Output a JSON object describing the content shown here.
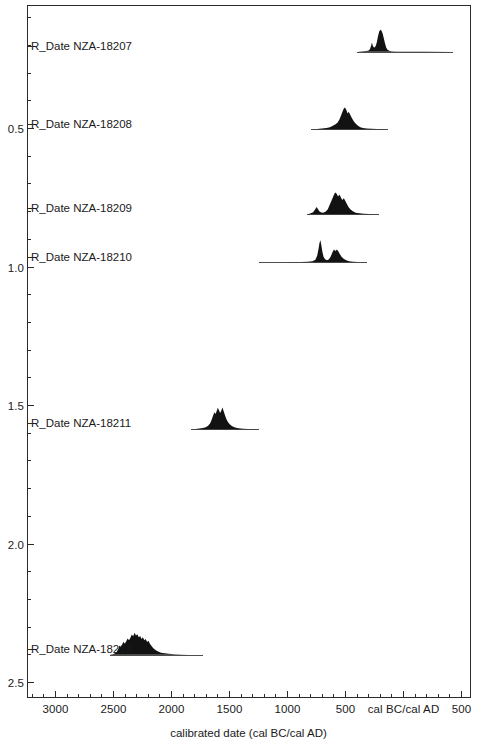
{
  "chart_data": {
    "type": "area",
    "title": "",
    "subtitle": "",
    "xlabel": "calibrated date (cal BC/cal AD)",
    "ylabel": "",
    "xlim": [
      3250,
      620
    ],
    "x_tick_labels": [
      "3000",
      "2500",
      "2000",
      "1500",
      "1000",
      "500",
      "cal BC/cal AD",
      "500"
    ],
    "x_tick_values": [
      3000,
      2500,
      2000,
      1500,
      1000,
      500,
      0,
      -500
    ],
    "x_minor_interval": 100,
    "ylim": [
      0.0,
      2.68
    ],
    "y_tick_labels": [
      "0.5",
      "1.0",
      "1.5",
      "2.0",
      "2.5"
    ],
    "y_tick_values": [
      0.5,
      1.0,
      1.5,
      2.0,
      2.5
    ],
    "y_minor_interval": 0.1,
    "grid": false,
    "legend": "none",
    "frame_color": "#2b2b2b",
    "distribution_color": "#121212",
    "series": [
      {
        "name": "R_Date NZA-18207",
        "label": "R_Date NZA-18207",
        "row": 0,
        "label_y": 0.205,
        "baseline_y": 0.225,
        "range_start": 395,
        "range_end": -430,
        "profile": [
          [
            395,
            0.0
          ],
          [
            370,
            0.02
          ],
          [
            345,
            0.03
          ],
          [
            320,
            0.04
          ],
          [
            300,
            0.05
          ],
          [
            285,
            0.12
          ],
          [
            275,
            0.28
          ],
          [
            268,
            0.42
          ],
          [
            262,
            0.3
          ],
          [
            255,
            0.22
          ],
          [
            245,
            0.2
          ],
          [
            235,
            0.26
          ],
          [
            225,
            0.45
          ],
          [
            215,
            0.72
          ],
          [
            205,
            0.92
          ],
          [
            195,
            1.0
          ],
          [
            185,
            0.96
          ],
          [
            175,
            0.82
          ],
          [
            165,
            0.6
          ],
          [
            155,
            0.38
          ],
          [
            145,
            0.2
          ],
          [
            135,
            0.1
          ],
          [
            120,
            0.05
          ],
          [
            100,
            0.03
          ],
          [
            60,
            0.02
          ],
          [
            0,
            0.01
          ],
          [
            -200,
            0.01
          ],
          [
            -430,
            0.0
          ]
        ]
      },
      {
        "name": "R_Date NZA-18208",
        "label": "R_Date NZA-18208",
        "row": 1,
        "label_y": 0.485,
        "baseline_y": 0.505,
        "range_start": 790,
        "range_end": 130,
        "profile": [
          [
            790,
            0.0
          ],
          [
            740,
            0.02
          ],
          [
            700,
            0.04
          ],
          [
            660,
            0.06
          ],
          [
            630,
            0.1
          ],
          [
            605,
            0.16
          ],
          [
            585,
            0.22
          ],
          [
            565,
            0.3
          ],
          [
            548,
            0.45
          ],
          [
            535,
            0.62
          ],
          [
            522,
            0.8
          ],
          [
            510,
            0.95
          ],
          [
            500,
            1.0
          ],
          [
            488,
            0.88
          ],
          [
            478,
            0.72
          ],
          [
            468,
            0.8
          ],
          [
            458,
            0.7
          ],
          [
            448,
            0.58
          ],
          [
            435,
            0.46
          ],
          [
            420,
            0.34
          ],
          [
            405,
            0.24
          ],
          [
            388,
            0.16
          ],
          [
            368,
            0.1
          ],
          [
            345,
            0.06
          ],
          [
            315,
            0.04
          ],
          [
            275,
            0.03
          ],
          [
            225,
            0.02
          ],
          [
            175,
            0.01
          ],
          [
            130,
            0.0
          ]
        ]
      },
      {
        "name": "R_Date NZA-18209",
        "label": "R_Date NZA-18209",
        "row": 2,
        "label_y": 0.79,
        "baseline_y": 0.812,
        "range_start": 830,
        "range_end": 210,
        "profile": [
          [
            830,
            0.0
          ],
          [
            800,
            0.04
          ],
          [
            775,
            0.1
          ],
          [
            758,
            0.22
          ],
          [
            745,
            0.34
          ],
          [
            735,
            0.26
          ],
          [
            722,
            0.14
          ],
          [
            705,
            0.09
          ],
          [
            688,
            0.08
          ],
          [
            668,
            0.12
          ],
          [
            648,
            0.24
          ],
          [
            630,
            0.46
          ],
          [
            612,
            0.68
          ],
          [
            598,
            0.86
          ],
          [
            585,
            1.0
          ],
          [
            572,
            0.94
          ],
          [
            560,
            0.82
          ],
          [
            548,
            0.9
          ],
          [
            536,
            0.78
          ],
          [
            524,
            0.66
          ],
          [
            510,
            0.74
          ],
          [
            498,
            0.62
          ],
          [
            485,
            0.48
          ],
          [
            470,
            0.34
          ],
          [
            452,
            0.22
          ],
          [
            432,
            0.14
          ],
          [
            408,
            0.08
          ],
          [
            378,
            0.05
          ],
          [
            338,
            0.03
          ],
          [
            290,
            0.02
          ],
          [
            245,
            0.01
          ],
          [
            210,
            0.0
          ]
        ]
      },
      {
        "name": "R_Date NZA-18210",
        "label": "R_Date NZA-18210",
        "row": 3,
        "label_y": 0.965,
        "baseline_y": 0.985,
        "range_start": 1240,
        "range_end": 310,
        "profile": [
          [
            1240,
            0.0
          ],
          [
            1150,
            0.01
          ],
          [
            1050,
            0.01
          ],
          [
            950,
            0.02
          ],
          [
            880,
            0.02
          ],
          [
            820,
            0.03
          ],
          [
            780,
            0.05
          ],
          [
            755,
            0.12
          ],
          [
            740,
            0.3
          ],
          [
            728,
            0.62
          ],
          [
            720,
            0.88
          ],
          [
            712,
            1.0
          ],
          [
            704,
            0.78
          ],
          [
            695,
            0.48
          ],
          [
            685,
            0.26
          ],
          [
            672,
            0.14
          ],
          [
            655,
            0.1
          ],
          [
            638,
            0.14
          ],
          [
            622,
            0.28
          ],
          [
            608,
            0.46
          ],
          [
            595,
            0.58
          ],
          [
            582,
            0.52
          ],
          [
            570,
            0.58
          ],
          [
            558,
            0.5
          ],
          [
            545,
            0.38
          ],
          [
            530,
            0.26
          ],
          [
            512,
            0.16
          ],
          [
            490,
            0.09
          ],
          [
            465,
            0.05
          ],
          [
            430,
            0.03
          ],
          [
            390,
            0.02
          ],
          [
            350,
            0.01
          ],
          [
            310,
            0.0
          ]
        ]
      },
      {
        "name": "R_Date NZA-18211",
        "label": "R_Date NZA-18211",
        "row": 4,
        "label_y": 1.565,
        "baseline_y": 1.588,
        "range_start": 1830,
        "range_end": 1240,
        "profile": [
          [
            1830,
            0.0
          ],
          [
            1790,
            0.02
          ],
          [
            1755,
            0.04
          ],
          [
            1725,
            0.06
          ],
          [
            1700,
            0.1
          ],
          [
            1680,
            0.16
          ],
          [
            1662,
            0.28
          ],
          [
            1648,
            0.46
          ],
          [
            1636,
            0.64
          ],
          [
            1626,
            0.78
          ],
          [
            1616,
            0.7
          ],
          [
            1606,
            0.84
          ],
          [
            1596,
            0.98
          ],
          [
            1586,
            0.86
          ],
          [
            1576,
            0.74
          ],
          [
            1566,
            0.86
          ],
          [
            1556,
            1.0
          ],
          [
            1546,
            0.82
          ],
          [
            1535,
            0.64
          ],
          [
            1522,
            0.46
          ],
          [
            1508,
            0.32
          ],
          [
            1492,
            0.22
          ],
          [
            1472,
            0.14
          ],
          [
            1448,
            0.08
          ],
          [
            1418,
            0.05
          ],
          [
            1380,
            0.03
          ],
          [
            1335,
            0.02
          ],
          [
            1290,
            0.01
          ],
          [
            1240,
            0.0
          ]
        ]
      },
      {
        "name": "R_Date NZA-18212",
        "label": "R_Date NZA-18212",
        "row": 5,
        "label_y": 2.38,
        "baseline_y": 2.402,
        "range_start": 2530,
        "range_end": 1720,
        "profile": [
          [
            2530,
            0.0
          ],
          [
            2495,
            0.04
          ],
          [
            2470,
            0.12
          ],
          [
            2455,
            0.26
          ],
          [
            2444,
            0.42
          ],
          [
            2434,
            0.34
          ],
          [
            2422,
            0.46
          ],
          [
            2410,
            0.6
          ],
          [
            2398,
            0.5
          ],
          [
            2386,
            0.62
          ],
          [
            2374,
            0.74
          ],
          [
            2362,
            0.66
          ],
          [
            2350,
            0.78
          ],
          [
            2338,
            0.92
          ],
          [
            2326,
            0.84
          ],
          [
            2314,
            1.0
          ],
          [
            2302,
            0.88
          ],
          [
            2290,
            0.94
          ],
          [
            2278,
            0.8
          ],
          [
            2266,
            0.86
          ],
          [
            2254,
            0.72
          ],
          [
            2242,
            0.8
          ],
          [
            2230,
            0.66
          ],
          [
            2218,
            0.72
          ],
          [
            2206,
            0.58
          ],
          [
            2194,
            0.64
          ],
          [
            2182,
            0.5
          ],
          [
            2168,
            0.4
          ],
          [
            2152,
            0.3
          ],
          [
            2134,
            0.22
          ],
          [
            2112,
            0.15
          ],
          [
            2086,
            0.1
          ],
          [
            2055,
            0.07
          ],
          [
            2020,
            0.05
          ],
          [
            1975,
            0.03
          ],
          [
            1920,
            0.02
          ],
          [
            1850,
            0.01
          ],
          [
            1790,
            0.01
          ],
          [
            1720,
            0.0
          ]
        ]
      }
    ]
  },
  "geometry": {
    "plot_left": 27,
    "plot_right": 470,
    "plot_top": 5,
    "plot_bottom": 697,
    "x_ref_value": 3000,
    "x_ref_px": 55,
    "px_per_500yr": 58.0,
    "y_ref_value": 0.5,
    "y_ref_px": 128,
    "px_per_unit_y": 277.0,
    "dist_max_height_px": 22
  },
  "axis": {
    "x_title": "calibrated date (cal BC/cal AD)"
  }
}
